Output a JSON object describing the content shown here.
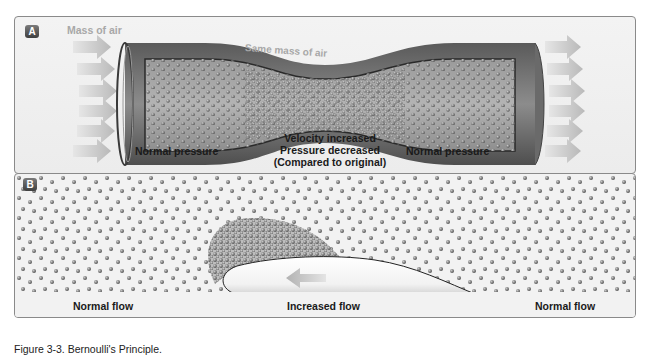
{
  "panel_a": {
    "badge": "A",
    "mass_label": "Mass of air",
    "same_mass_label": "Same mass of air",
    "left_label": "Normal pressure",
    "center_label": {
      "line1": "Velocity increased",
      "line2": "Pressure decreased",
      "line3": "(Compared to original)"
    },
    "right_label": "Normal pressure",
    "arrow_count_left": 6,
    "arrow_count_right": 6
  },
  "panel_b": {
    "badge": "B",
    "left_label": "Normal flow",
    "center_label": "Increased flow",
    "right_label": "Normal flow"
  },
  "caption": "Figure 3-3. Bernoulli's Principle."
}
